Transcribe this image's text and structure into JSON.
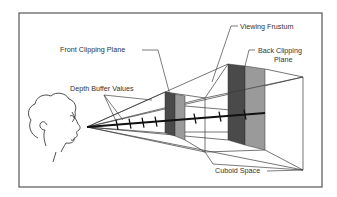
{
  "figure": {
    "labels": {
      "viewing_frustum": "Viewing Frustum",
      "front_clipping_plane": "Front Clipping Plane",
      "back_clipping_plane_line1": "Back Clipping",
      "back_clipping_plane_line2": "Plane",
      "depth_buffer_values": "Depth Buffer Values",
      "cuboid_space": "Cuboid Space"
    },
    "colors": {
      "frame": "#555555",
      "plane_dark": "#4a4a4a",
      "plane_gray": "#9a9a9a",
      "line": "#3a3a3a",
      "axis": "#111111"
    },
    "depth_tick_count": 7
  }
}
